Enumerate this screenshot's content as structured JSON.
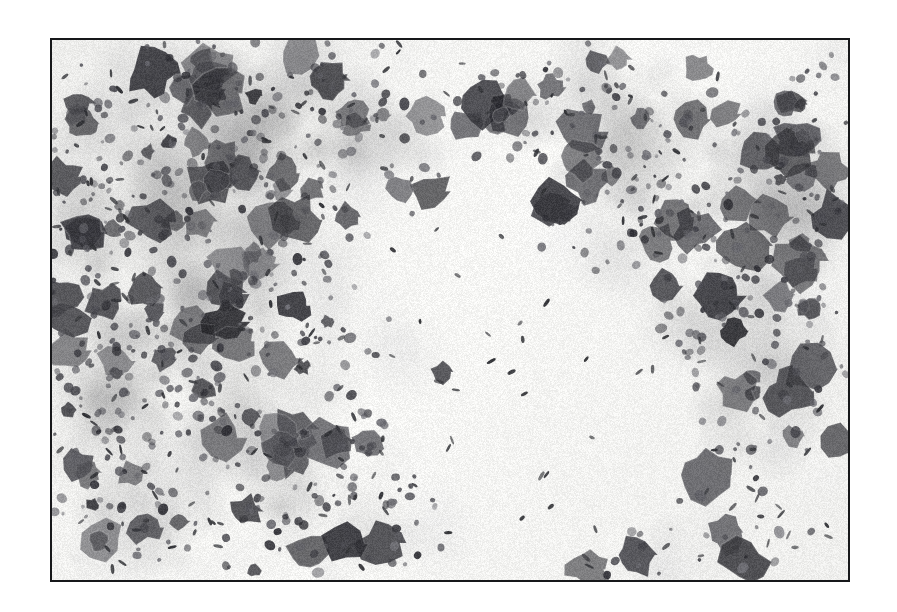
{
  "page": {
    "background_color": "#ffffff",
    "kind": "photomicrograph-figure"
  },
  "figure": {
    "frame": {
      "border_color": "#17181a",
      "border_width_px": 2,
      "x": 50,
      "y": 38,
      "width": 800,
      "height": 544
    },
    "caption": "",
    "image": {
      "modality": "light-microscopy",
      "staining": "grayscale / monochrome reproduction",
      "background_color": "#f6f6f4",
      "mid_tone_color": "#9a9a98",
      "dark_tone_color": "#2d2d2f",
      "description": "Cytology smear showing clustered cells with densely stained nuclei and abundant small rod-shaped bacilli scattered across a pale background",
      "seed": 20240917,
      "regions": [
        {
          "name": "upper-left-cell-cluster",
          "cx": 0.14,
          "cy": 0.2,
          "rx": 0.17,
          "ry": 0.2,
          "density": 0.95,
          "tone": 0.52
        },
        {
          "name": "left-mid-cell-cluster",
          "cx": 0.1,
          "cy": 0.48,
          "rx": 0.14,
          "ry": 0.2,
          "density": 0.92,
          "tone": 0.55
        },
        {
          "name": "lower-left-cell-cluster",
          "cx": 0.13,
          "cy": 0.8,
          "rx": 0.16,
          "ry": 0.2,
          "density": 0.88,
          "tone": 0.5
        },
        {
          "name": "upper-center-cluster",
          "cx": 0.34,
          "cy": 0.16,
          "rx": 0.16,
          "ry": 0.16,
          "density": 0.85,
          "tone": 0.48
        },
        {
          "name": "center-left-cluster",
          "cx": 0.26,
          "cy": 0.52,
          "rx": 0.14,
          "ry": 0.2,
          "density": 0.8,
          "tone": 0.52
        },
        {
          "name": "bottom-center-cluster",
          "cx": 0.4,
          "cy": 0.86,
          "rx": 0.14,
          "ry": 0.14,
          "density": 0.78,
          "tone": 0.45
        },
        {
          "name": "center-debris-cluster",
          "cx": 0.47,
          "cy": 0.63,
          "rx": 0.08,
          "ry": 0.1,
          "density": 0.62,
          "tone": 0.55
        },
        {
          "name": "upper-right-cluster",
          "cx": 0.68,
          "cy": 0.12,
          "rx": 0.12,
          "ry": 0.13,
          "density": 0.8,
          "tone": 0.47
        },
        {
          "name": "right-mid-cluster",
          "cx": 0.8,
          "cy": 0.3,
          "rx": 0.15,
          "ry": 0.2,
          "density": 0.88,
          "tone": 0.45
        },
        {
          "name": "right-lower-cluster",
          "cx": 0.88,
          "cy": 0.62,
          "rx": 0.13,
          "ry": 0.18,
          "density": 0.85,
          "tone": 0.46
        },
        {
          "name": "far-right-edge-cluster",
          "cx": 0.97,
          "cy": 0.2,
          "rx": 0.07,
          "ry": 0.22,
          "density": 0.75,
          "tone": 0.5
        },
        {
          "name": "bottom-right-sparse",
          "cx": 0.78,
          "cy": 0.92,
          "rx": 0.14,
          "ry": 0.1,
          "density": 0.45,
          "tone": 0.6
        },
        {
          "name": "clear-central-field",
          "cx": 0.62,
          "cy": 0.72,
          "rx": 0.17,
          "ry": 0.2,
          "density": 0.05,
          "tone": 0.95
        }
      ],
      "bacilli": {
        "name": "rod-shaped-bacilli",
        "count": 430,
        "length_px_range": [
          5,
          11
        ],
        "width_px_range": [
          2.2,
          4.0
        ],
        "color": "#35363a",
        "concentration": "highest in mid-field and around cell clusters"
      },
      "nuclei": {
        "name": "stained-cell-nuclei",
        "count": 160,
        "radius_px_range": [
          6,
          26
        ],
        "color_dark": "#43444a",
        "color_mid": "#73747a"
      }
    }
  }
}
